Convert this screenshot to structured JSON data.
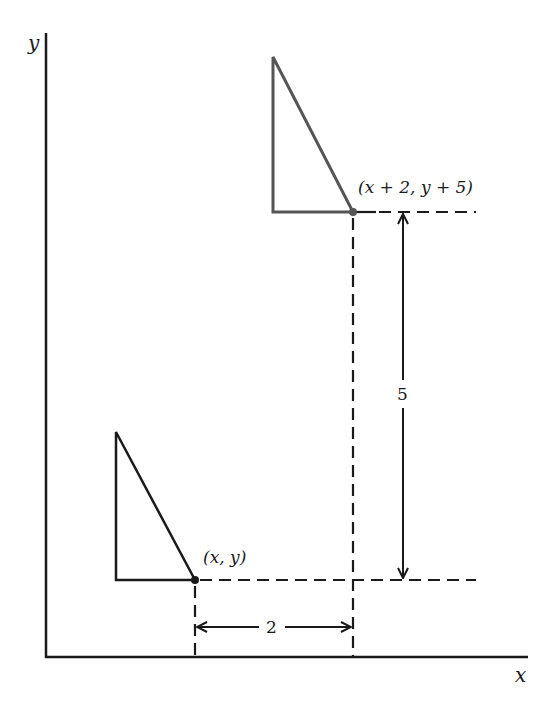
{
  "axes": {
    "x_label": "x",
    "y_label": "y"
  },
  "points": {
    "original": {
      "label": "(x, y)"
    },
    "translated": {
      "label": "(x + 2, y + 5)"
    }
  },
  "dimensions": {
    "horizontal_shift": "2",
    "vertical_shift": "5"
  },
  "colors": {
    "stroke": "#1a1a1a",
    "translated_stroke": "#555555",
    "background": "#ffffff"
  }
}
